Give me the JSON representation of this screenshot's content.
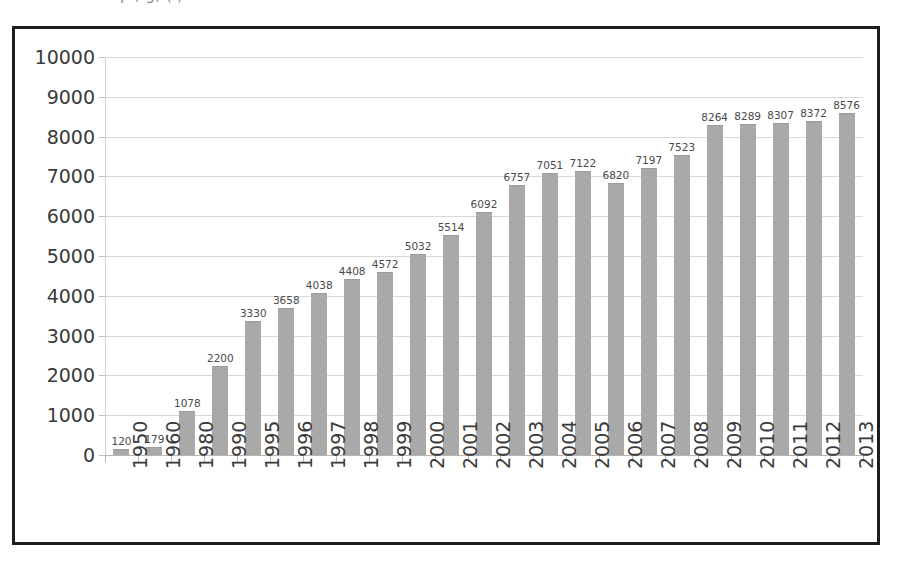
{
  "caption": {
    "cut_off_line": "p        ,    g,                            (        )"
  },
  "chart_data": {
    "type": "bar",
    "title": "",
    "xlabel": "",
    "ylabel": "",
    "ylim": [
      0,
      10000
    ],
    "ytick_step": 1000,
    "grid": true,
    "legend": false,
    "bar_color": "#a9a9a9",
    "value_labels": true,
    "ytick_labels": [
      "10000",
      "9000",
      "8000",
      "7000",
      "6000",
      "5000",
      "4000",
      "3000",
      "2000",
      "1000",
      "0"
    ],
    "categories": [
      "1950",
      "1960",
      "1980",
      "1990",
      "1995",
      "1996",
      "1997",
      "1998",
      "1999",
      "2000",
      "2001",
      "2002",
      "2003",
      "2004",
      "2005",
      "2006",
      "2007",
      "2008",
      "2009",
      "2010",
      "2011",
      "2012",
      "2013"
    ],
    "values": [
      120,
      179,
      1078,
      2200,
      3330,
      3658,
      4038,
      4408,
      4572,
      5032,
      5514,
      6092,
      6757,
      7051,
      7122,
      6820,
      7197,
      7523,
      8264,
      8289,
      8307,
      8372,
      8576
    ],
    "value_strings": [
      "120",
      "179",
      "1078",
      "2200",
      "3330",
      "3658",
      "4038",
      "4408",
      "4572",
      "5032",
      "5514",
      "6092",
      "6757",
      "7051",
      "7122",
      "6820",
      "7197",
      "7523",
      "8264",
      "8289",
      "8307",
      "8372",
      "8576"
    ]
  }
}
